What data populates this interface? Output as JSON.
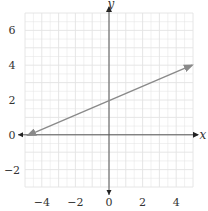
{
  "chart_data": {
    "type": "line",
    "title": "",
    "xlabel": "x",
    "ylabel": "y",
    "xlim": [
      -5,
      5
    ],
    "ylim": [
      -3,
      7
    ],
    "grid": true,
    "x_ticks": [
      "−4",
      "−2",
      "0",
      "2",
      "4"
    ],
    "x_tick_values": [
      -4,
      -2,
      0,
      2,
      4
    ],
    "y_ticks": [
      "6",
      "4",
      "2",
      "0",
      "−2"
    ],
    "y_tick_values": [
      6,
      4,
      2,
      0,
      -2
    ],
    "series": [
      {
        "name": "line",
        "x": [
          -5,
          5
        ],
        "y": [
          0,
          4
        ],
        "equation": "y = 0.4x + 2",
        "arrows_both_ends": true,
        "color": "#8a8a8a"
      }
    ]
  },
  "colors": {
    "grid": "#e3e3e3",
    "axis": "#555555",
    "line": "#8a8a8a"
  }
}
